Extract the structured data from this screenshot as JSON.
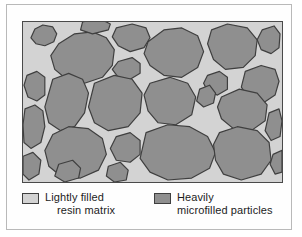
{
  "figure": {
    "panel": {
      "name": "microstructure-panel",
      "matrix_color": "#d3d3d3",
      "particle_color": "#8f8f8f",
      "particle_outline_color": "#3f3f3f",
      "frame_color": "#4a4a4a",
      "particle_count": 26
    }
  },
  "legend": {
    "items": [
      {
        "swatch": "light",
        "swatch_color": "#d3d3d3",
        "line1": "Lightly filled",
        "line2": "resin matrix"
      },
      {
        "swatch": "dark",
        "swatch_color": "#8f8f8f",
        "line1": "Heavily",
        "line2": "microfilled particles"
      }
    ]
  }
}
